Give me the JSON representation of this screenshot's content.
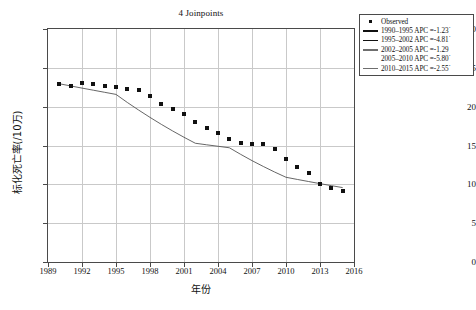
{
  "chart_data": {
    "type": "line",
    "title": "4 Joinpoints",
    "xlabel": "年份",
    "ylabel": "标化死亡率(/10万)",
    "xlim": [
      1989,
      2016
    ],
    "ylim": [
      0,
      30
    ],
    "grid": true,
    "legend_position": "top-right-outside",
    "x_ticks": [
      "1989",
      "1992",
      "1995",
      "1998",
      "2001",
      "2004",
      "2007",
      "2010",
      "2013",
      "2016"
    ],
    "y_ticks": [
      "0",
      "5",
      "10",
      "15",
      "20",
      "25",
      "30"
    ],
    "x": [
      1990,
      1991,
      1992,
      1993,
      1994,
      1995,
      1996,
      1997,
      1998,
      1999,
      2000,
      2001,
      2002,
      2003,
      2004,
      2005,
      2006,
      2007,
      2008,
      2009,
      2010,
      2011,
      2012,
      2013,
      2014,
      2015
    ],
    "series": [
      {
        "name": "Observed",
        "marker": "square",
        "color": "#111111",
        "values": [
          22.9,
          22.7,
          23.0,
          22.9,
          22.6,
          22.5,
          22.3,
          22.2,
          21.4,
          20.3,
          19.7,
          19.0,
          18.0,
          17.3,
          16.6,
          15.9,
          15.3,
          15.2,
          15.2,
          14.6,
          13.2,
          12.2,
          11.4,
          10.0,
          9.5,
          9.1
        ]
      },
      {
        "name": "Fitted joinpoint regression",
        "color": "#555555",
        "values": [
          22.95,
          22.67,
          22.39,
          22.12,
          21.85,
          21.58,
          20.54,
          19.56,
          18.62,
          17.72,
          16.87,
          16.06,
          15.29,
          15.09,
          14.9,
          14.71,
          13.86,
          13.05,
          12.3,
          11.58,
          10.91,
          10.63,
          10.36,
          10.09,
          9.83,
          9.58
        ]
      }
    ],
    "legend": [
      {
        "label": "Observed",
        "swatch": "square-marker"
      },
      {
        "label": "1990–1995 APC =-1.23˙",
        "swatch": "line-black"
      },
      {
        "label": "1995–2002 APC =-4.81˙",
        "swatch": "line-black"
      },
      {
        "label": "2002–2005 APC =-1.29",
        "swatch": "line-gray"
      },
      {
        "label": "2005–2010 APC =-5.80˙",
        "swatch": "line-blank"
      },
      {
        "label": "2010–2015 APC =-2.55˙",
        "swatch": "line-gray"
      }
    ],
    "segments": [
      {
        "range": "1990–1995",
        "apc": "-1.23",
        "significant": true
      },
      {
        "range": "1995–2002",
        "apc": "-4.81",
        "significant": true
      },
      {
        "range": "2002–2005",
        "apc": "-1.29",
        "significant": false
      },
      {
        "range": "2005–2010",
        "apc": "-5.80",
        "significant": true
      },
      {
        "range": "2010–2015",
        "apc": "-2.55",
        "significant": true
      }
    ],
    "colors": {
      "marker": "#111111",
      "fitline": "#555555",
      "grid": "#c9c9c9",
      "axis": "#4a4a4a",
      "background": "#ffffff"
    }
  }
}
